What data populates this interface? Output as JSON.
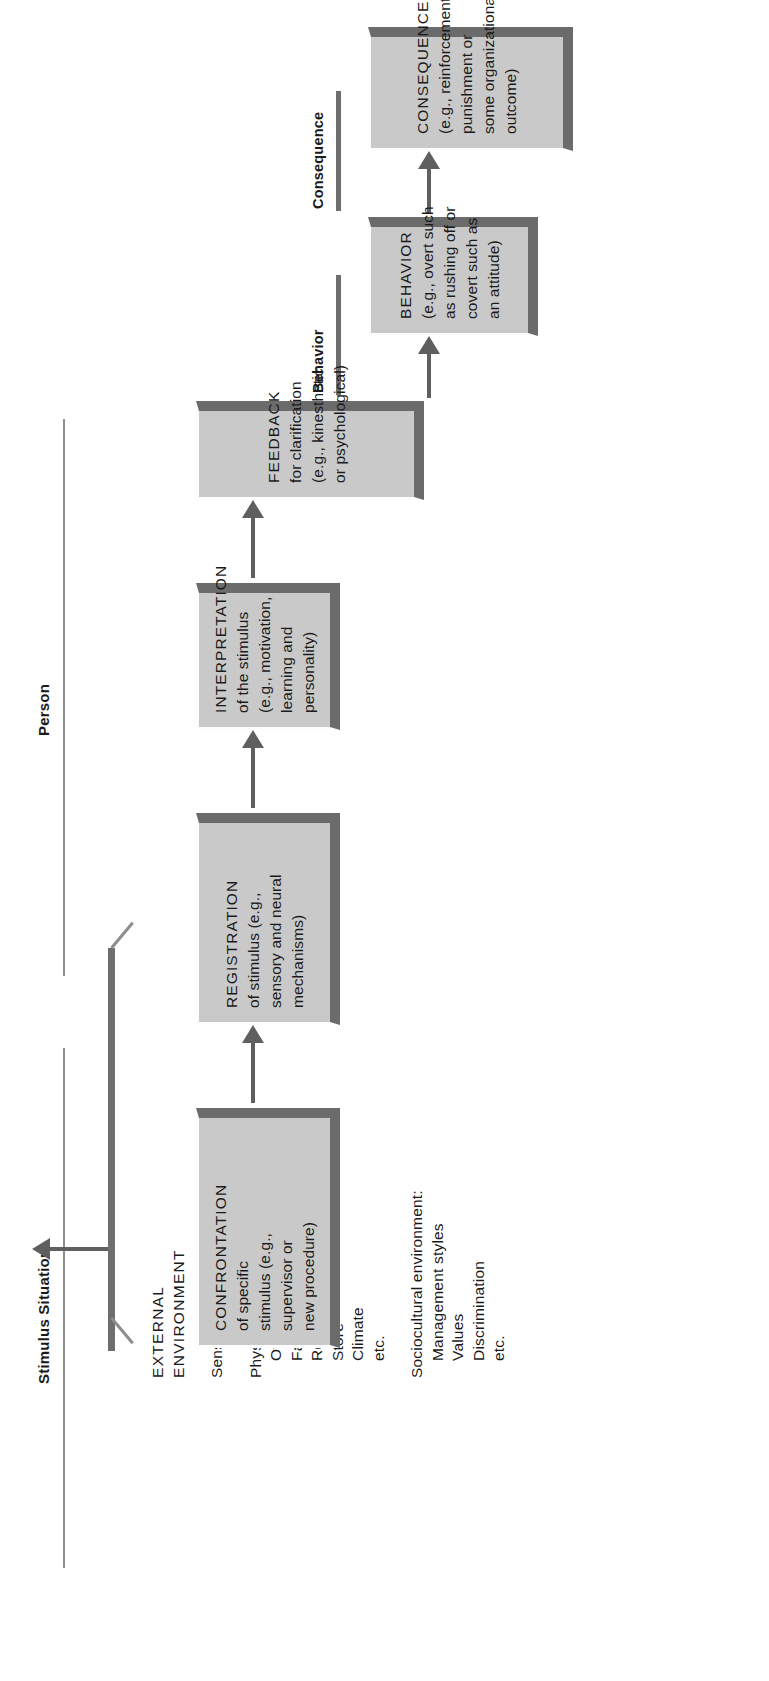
{
  "diagram": {
    "type": "flow",
    "orientation": "rotated-90-ccw",
    "title_sections": {
      "stimulus": "Stimulus Situation",
      "person": "Person",
      "behavior": "Behavior",
      "consequence": "Consequence"
    },
    "colors": {
      "box_fill": "#c9c9c9",
      "box_shadow": "#6b6b6b",
      "box_highlight": "#fdfdfd",
      "arrow": "#5f5f5f",
      "rule": "#8d8d8d",
      "bar": "#6e6e6e",
      "text": "#1a1a1a",
      "background": "#ffffff"
    },
    "boxes": [
      {
        "id": "confrontation",
        "title": "CONFRONTATION",
        "lines": [
          "of specific",
          "stimulus (e.g.,",
          "supervisor or",
          "new procedure)"
        ]
      },
      {
        "id": "registration",
        "title": "REGISTRATION",
        "lines": [
          "of stimulus (e.g.,",
          "sensory and neural",
          "mechanisms)"
        ]
      },
      {
        "id": "interpretation",
        "title": "INTERPRETATION",
        "lines": [
          "of the stimulus",
          "(e.g., motivation,",
          "learning and",
          "personality)"
        ]
      },
      {
        "id": "feedback",
        "title": "FEEDBACK",
        "lines": [
          "for clarification",
          "(e.g., kinesthetic",
          "or psychological)"
        ]
      },
      {
        "id": "behavior",
        "title": "BEHAVIOR",
        "lines": [
          "(e.g., overt such",
          "as rushing off or",
          "covert such as",
          "an attitude)"
        ]
      },
      {
        "id": "consequence",
        "title": "CONSEQUENCE",
        "lines": [
          "(e.g., reinforcement/",
          "punishment or",
          "some organizational",
          "outcome)"
        ]
      }
    ],
    "environment": {
      "heading": [
        "EXTERNAL",
        "ENVIRONMENT"
      ],
      "sensual": "Sensual stimulation",
      "physical_heading": "Physical environment:",
      "physical_items": [
        "Office",
        "Factory floor",
        "Research laboratory",
        "Store",
        "Climate",
        "etc."
      ],
      "sociocultural_heading": "Sociocultural environment:",
      "sociocultural_items": [
        "Management styles",
        "Values",
        "Discrimination",
        "etc."
      ]
    },
    "flow_edges": [
      {
        "from": "external-environment",
        "to": "confrontation"
      },
      {
        "from": "confrontation",
        "to": "registration"
      },
      {
        "from": "registration",
        "to": "interpretation"
      },
      {
        "from": "interpretation",
        "to": "feedback"
      },
      {
        "from": "feedback",
        "to": "behavior"
      },
      {
        "from": "behavior",
        "to": "consequence"
      }
    ]
  }
}
